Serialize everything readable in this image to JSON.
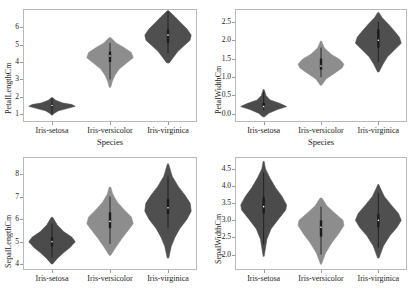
{
  "figure": {
    "background": "#ffffff",
    "axis_color": "#b9b9b9",
    "text_color": "#1a1a1a"
  },
  "colors": {
    "setosa": "#4b4b4b",
    "versicolor": "#8d8d8d",
    "virginica": "#4f4f4f",
    "box": "#1c1c1c",
    "whisker": "#1c1c1c",
    "median": "#ffffff"
  },
  "categories": [
    "Iris-setosa",
    "Iris-versicolor",
    "Iris-virginica"
  ],
  "xlabel": "Species",
  "chart_data": [
    {
      "type": "violin",
      "panel": "top-left",
      "title": "",
      "xlabel": "Species",
      "ylabel": "PetalLengthCm",
      "ylim": [
        0.55,
        7.05
      ],
      "yticks": [
        1,
        2,
        3,
        4,
        5,
        6
      ],
      "ytick_labels": [
        "1",
        "2",
        "3",
        "4",
        "5",
        "6"
      ],
      "categories": [
        "Iris-setosa",
        "Iris-versicolor",
        "Iris-virginica"
      ],
      "series": [
        {
          "name": "Iris-setosa",
          "color": "#4b4b4b",
          "min": 1.0,
          "q1": 1.4,
          "median": 1.5,
          "q3": 1.575,
          "max": 1.9,
          "width": 1.0,
          "density": [
            {
              "y": 0.95,
              "w": 0.02
            },
            {
              "y": 1.05,
              "w": 0.1
            },
            {
              "y": 1.2,
              "w": 0.28
            },
            {
              "y": 1.35,
              "w": 0.72
            },
            {
              "y": 1.45,
              "w": 1.0
            },
            {
              "y": 1.55,
              "w": 0.86
            },
            {
              "y": 1.65,
              "w": 0.46
            },
            {
              "y": 1.8,
              "w": 0.16
            },
            {
              "y": 1.95,
              "w": 0.03
            }
          ]
        },
        {
          "name": "Iris-versicolor",
          "color": "#8d8d8d",
          "min": 3.0,
          "q1": 4.0,
          "median": 4.35,
          "q3": 4.6,
          "max": 5.1,
          "width": 1.0,
          "density": [
            {
              "y": 2.55,
              "w": 0.03
            },
            {
              "y": 2.9,
              "w": 0.1
            },
            {
              "y": 3.25,
              "w": 0.22
            },
            {
              "y": 3.6,
              "w": 0.4
            },
            {
              "y": 3.95,
              "w": 0.72
            },
            {
              "y": 4.25,
              "w": 1.0
            },
            {
              "y": 4.55,
              "w": 0.92
            },
            {
              "y": 4.85,
              "w": 0.58
            },
            {
              "y": 5.1,
              "w": 0.26
            },
            {
              "y": 5.4,
              "w": 0.04
            }
          ]
        },
        {
          "name": "Iris-virginica",
          "color": "#4f4f4f",
          "min": 4.5,
          "q1": 5.1,
          "median": 5.55,
          "q3": 5.875,
          "max": 6.9,
          "width": 1.0,
          "density": [
            {
              "y": 3.95,
              "w": 0.05
            },
            {
              "y": 4.25,
              "w": 0.22
            },
            {
              "y": 4.6,
              "w": 0.42
            },
            {
              "y": 4.95,
              "w": 0.7
            },
            {
              "y": 5.25,
              "w": 0.95
            },
            {
              "y": 5.55,
              "w": 1.0
            },
            {
              "y": 5.9,
              "w": 0.82
            },
            {
              "y": 6.25,
              "w": 0.56
            },
            {
              "y": 6.6,
              "w": 0.3
            },
            {
              "y": 6.95,
              "w": 0.03
            }
          ]
        }
      ]
    },
    {
      "type": "violin",
      "panel": "top-right",
      "title": "",
      "xlabel": "Species",
      "ylabel": "PetalWidthCm",
      "ylim": [
        -0.22,
        2.85
      ],
      "yticks": [
        0.0,
        0.5,
        1.0,
        1.5,
        2.0,
        2.5
      ],
      "ytick_labels": [
        "0.0",
        "0.5",
        "1.0",
        "1.5",
        "2.0",
        "2.5"
      ],
      "categories": [
        "Iris-setosa",
        "Iris-versicolor",
        "Iris-virginica"
      ],
      "series": [
        {
          "name": "Iris-setosa",
          "color": "#4b4b4b",
          "min": 0.1,
          "q1": 0.2,
          "median": 0.2,
          "q3": 0.3,
          "max": 0.6,
          "width": 1.0,
          "density": [
            {
              "y": -0.08,
              "w": 0.04
            },
            {
              "y": 0.02,
              "w": 0.22
            },
            {
              "y": 0.12,
              "w": 0.6
            },
            {
              "y": 0.2,
              "w": 1.0
            },
            {
              "y": 0.28,
              "w": 0.72
            },
            {
              "y": 0.38,
              "w": 0.28
            },
            {
              "y": 0.5,
              "w": 0.1
            },
            {
              "y": 0.66,
              "w": 0.02
            }
          ]
        },
        {
          "name": "Iris-versicolor",
          "color": "#8d8d8d",
          "min": 1.0,
          "q1": 1.2,
          "median": 1.3,
          "q3": 1.5,
          "max": 1.8,
          "width": 1.0,
          "density": [
            {
              "y": 0.78,
              "w": 0.03
            },
            {
              "y": 0.95,
              "w": 0.22
            },
            {
              "y": 1.1,
              "w": 0.58
            },
            {
              "y": 1.25,
              "w": 0.92
            },
            {
              "y": 1.35,
              "w": 1.0
            },
            {
              "y": 1.48,
              "w": 0.82
            },
            {
              "y": 1.62,
              "w": 0.44
            },
            {
              "y": 1.8,
              "w": 0.14
            },
            {
              "y": 1.98,
              "w": 0.02
            }
          ]
        },
        {
          "name": "Iris-virginica",
          "color": "#4f4f4f",
          "min": 1.4,
          "q1": 1.8,
          "median": 2.0,
          "q3": 2.3,
          "max": 2.5,
          "width": 1.0,
          "density": [
            {
              "y": 1.14,
              "w": 0.03
            },
            {
              "y": 1.35,
              "w": 0.2
            },
            {
              "y": 1.55,
              "w": 0.4
            },
            {
              "y": 1.75,
              "w": 0.72
            },
            {
              "y": 1.92,
              "w": 1.0
            },
            {
              "y": 2.08,
              "w": 0.92
            },
            {
              "y": 2.25,
              "w": 0.7
            },
            {
              "y": 2.45,
              "w": 0.42
            },
            {
              "y": 2.62,
              "w": 0.16
            },
            {
              "y": 2.75,
              "w": 0.03
            }
          ]
        }
      ]
    },
    {
      "type": "violin",
      "panel": "bottom-left",
      "title": "",
      "xlabel": "",
      "ylabel": "SepalLengthCm",
      "ylim": [
        3.75,
        8.75
      ],
      "yticks": [
        4,
        5,
        6,
        7,
        8
      ],
      "ytick_labels": [
        "4",
        "5",
        "6",
        "7",
        "8"
      ],
      "categories": [
        "Iris-setosa",
        "Iris-versicolor",
        "Iris-virginica"
      ],
      "series": [
        {
          "name": "Iris-setosa",
          "color": "#4b4b4b",
          "min": 4.3,
          "q1": 4.8,
          "median": 5.0,
          "q3": 5.2,
          "max": 5.8,
          "width": 1.0,
          "density": [
            {
              "y": 4.02,
              "w": 0.03
            },
            {
              "y": 4.25,
              "w": 0.22
            },
            {
              "y": 4.5,
              "w": 0.48
            },
            {
              "y": 4.75,
              "w": 0.78
            },
            {
              "y": 5.0,
              "w": 1.0
            },
            {
              "y": 5.2,
              "w": 0.86
            },
            {
              "y": 5.45,
              "w": 0.5
            },
            {
              "y": 5.75,
              "w": 0.22
            },
            {
              "y": 6.08,
              "w": 0.03
            }
          ]
        },
        {
          "name": "Iris-versicolor",
          "color": "#8d8d8d",
          "min": 4.9,
          "q1": 5.6,
          "median": 5.9,
          "q3": 6.3,
          "max": 7.0,
          "width": 1.0,
          "density": [
            {
              "y": 4.4,
              "w": 0.03
            },
            {
              "y": 4.8,
              "w": 0.28
            },
            {
              "y": 5.15,
              "w": 0.52
            },
            {
              "y": 5.5,
              "w": 0.78
            },
            {
              "y": 5.8,
              "w": 1.0
            },
            {
              "y": 6.1,
              "w": 0.92
            },
            {
              "y": 6.4,
              "w": 0.62
            },
            {
              "y": 6.75,
              "w": 0.32
            },
            {
              "y": 7.1,
              "w": 0.12
            },
            {
              "y": 7.42,
              "w": 0.03
            }
          ]
        },
        {
          "name": "Iris-virginica",
          "color": "#4f4f4f",
          "min": 5.6,
          "q1": 6.225,
          "median": 6.5,
          "q3": 6.9,
          "max": 7.9,
          "width": 1.0,
          "density": [
            {
              "y": 4.28,
              "w": 0.03
            },
            {
              "y": 4.8,
              "w": 0.14
            },
            {
              "y": 5.2,
              "w": 0.3
            },
            {
              "y": 5.6,
              "w": 0.52
            },
            {
              "y": 6.0,
              "w": 0.82
            },
            {
              "y": 6.35,
              "w": 1.0
            },
            {
              "y": 6.7,
              "w": 0.96
            },
            {
              "y": 7.05,
              "w": 0.74
            },
            {
              "y": 7.45,
              "w": 0.44
            },
            {
              "y": 7.9,
              "w": 0.18
            },
            {
              "y": 8.45,
              "w": 0.02
            }
          ]
        }
      ]
    },
    {
      "type": "violin",
      "panel": "bottom-right",
      "title": "",
      "xlabel": "",
      "ylabel": "SepalWidthCm",
      "ylim": [
        1.55,
        4.85
      ],
      "yticks": [
        2.0,
        2.5,
        3.0,
        3.5,
        4.0,
        4.5
      ],
      "ytick_labels": [
        "2.0",
        "2.5",
        "3.0",
        "3.5",
        "4.0",
        "4.5"
      ],
      "categories": [
        "Iris-setosa",
        "Iris-versicolor",
        "Iris-virginica"
      ],
      "series": [
        {
          "name": "Iris-setosa",
          "color": "#4b4b4b",
          "min": 2.3,
          "q1": 3.2,
          "median": 3.4,
          "q3": 3.675,
          "max": 4.4,
          "width": 1.0,
          "density": [
            {
              "y": 1.95,
              "w": 0.02
            },
            {
              "y": 2.45,
              "w": 0.14
            },
            {
              "y": 2.75,
              "w": 0.32
            },
            {
              "y": 3.05,
              "w": 0.66
            },
            {
              "y": 3.3,
              "w": 0.96
            },
            {
              "y": 3.45,
              "w": 1.0
            },
            {
              "y": 3.7,
              "w": 0.8
            },
            {
              "y": 3.95,
              "w": 0.52
            },
            {
              "y": 4.25,
              "w": 0.26
            },
            {
              "y": 4.5,
              "w": 0.08
            },
            {
              "y": 4.72,
              "w": 0.02
            }
          ]
        },
        {
          "name": "Iris-versicolor",
          "color": "#8d8d8d",
          "min": 2.0,
          "q1": 2.525,
          "median": 2.8,
          "q3": 3.0,
          "max": 3.4,
          "width": 1.0,
          "density": [
            {
              "y": 1.72,
              "w": 0.02
            },
            {
              "y": 2.05,
              "w": 0.2
            },
            {
              "y": 2.35,
              "w": 0.48
            },
            {
              "y": 2.6,
              "w": 0.76
            },
            {
              "y": 2.85,
              "w": 1.0
            },
            {
              "y": 3.0,
              "w": 0.96
            },
            {
              "y": 3.2,
              "w": 0.62
            },
            {
              "y": 3.42,
              "w": 0.26
            },
            {
              "y": 3.65,
              "w": 0.04
            }
          ]
        },
        {
          "name": "Iris-virginica",
          "color": "#4f4f4f",
          "min": 2.2,
          "q1": 2.8,
          "median": 3.0,
          "q3": 3.175,
          "max": 3.8,
          "width": 1.0,
          "density": [
            {
              "y": 1.9,
              "w": 0.03
            },
            {
              "y": 2.25,
              "w": 0.22
            },
            {
              "y": 2.55,
              "w": 0.5
            },
            {
              "y": 2.8,
              "w": 0.82
            },
            {
              "y": 3.0,
              "w": 1.0
            },
            {
              "y": 3.2,
              "w": 0.88
            },
            {
              "y": 3.45,
              "w": 0.56
            },
            {
              "y": 3.7,
              "w": 0.26
            },
            {
              "y": 3.95,
              "w": 0.08
            },
            {
              "y": 4.05,
              "w": 0.02
            }
          ]
        }
      ]
    }
  ]
}
